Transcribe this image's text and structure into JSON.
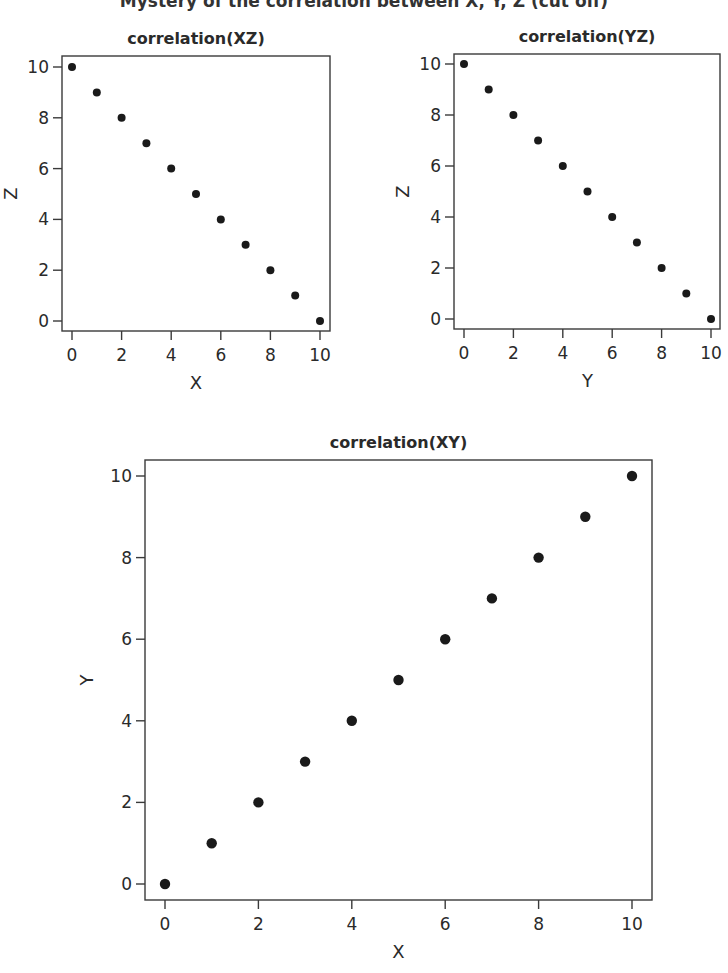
{
  "figure": {
    "main_title": "Mystery of the correlation between X, Y, Z (cut off)",
    "main_title_visible": false
  },
  "colors": {
    "point": "#1a1a1a",
    "axis": "#3a3a3a",
    "text": "#2a2a2a",
    "background": "#ffffff"
  },
  "chart_data": [
    {
      "type": "scatter",
      "title": "correlation(XZ)",
      "xlabel": "X",
      "ylabel": "Z",
      "xlim": [
        -0.4,
        10.4
      ],
      "ylim": [
        -0.4,
        10.4
      ],
      "xticks": [
        0,
        2,
        4,
        6,
        8,
        10
      ],
      "yticks": [
        0,
        2,
        4,
        6,
        8,
        10
      ],
      "grid": false,
      "legend": null,
      "x": [
        0,
        1,
        2,
        3,
        4,
        5,
        6,
        7,
        8,
        9,
        10
      ],
      "y": [
        10,
        9,
        8,
        7,
        6,
        5,
        4,
        3,
        2,
        1,
        0
      ],
      "layout": {
        "frame": [
          62,
          56,
          330,
          331
        ],
        "x0px": 72,
        "x10px": 320,
        "y0px": 321,
        "y10px": 67,
        "r": 4
      }
    },
    {
      "type": "scatter",
      "title": "correlation(YZ)",
      "xlabel": "Y",
      "ylabel": "Z",
      "xlim": [
        -0.4,
        10.4
      ],
      "ylim": [
        -0.4,
        10.4
      ],
      "xticks": [
        0,
        2,
        4,
        6,
        8,
        10
      ],
      "yticks": [
        0,
        2,
        4,
        6,
        8,
        10
      ],
      "grid": false,
      "legend": null,
      "x": [
        0,
        1,
        2,
        3,
        4,
        5,
        6,
        7,
        8,
        9,
        10
      ],
      "y": [
        10,
        9,
        8,
        7,
        6,
        5,
        4,
        3,
        2,
        1,
        0
      ],
      "layout": {
        "frame": [
          454,
          54,
          720,
          329
        ],
        "x0px": 464,
        "x10px": 711,
        "y0px": 319,
        "y10px": 64,
        "r": 4
      }
    },
    {
      "type": "scatter",
      "title": "correlation(XY)",
      "xlabel": "X",
      "ylabel": "Y",
      "xlim": [
        -0.4,
        10.4
      ],
      "ylim": [
        -0.4,
        10.4
      ],
      "xticks": [
        0,
        2,
        4,
        6,
        8,
        10
      ],
      "yticks": [
        0,
        2,
        4,
        6,
        8,
        10
      ],
      "grid": false,
      "legend": null,
      "x": [
        0,
        1,
        2,
        3,
        4,
        5,
        6,
        7,
        8,
        9,
        10
      ],
      "y": [
        0,
        1,
        2,
        3,
        4,
        5,
        6,
        7,
        8,
        9,
        10
      ],
      "layout": {
        "frame": [
          145,
          460,
          652,
          900
        ],
        "x0px": 165,
        "x10px": 632,
        "y0px": 884,
        "y10px": 476,
        "r": 5.2
      }
    }
  ]
}
